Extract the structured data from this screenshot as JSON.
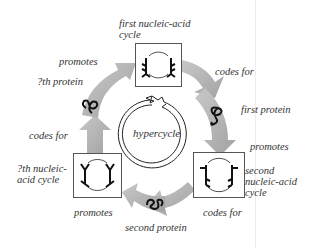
{
  "diagram": {
    "center_label": "hypercycle",
    "nodes": {
      "first_nucleic_acid_cycle": {
        "label_line1": "first nucleic-acid",
        "label_line2": "cycle"
      },
      "second_nucleic_acid_cycle": {
        "label_line1": "second",
        "label_line2": "nucleic-acid",
        "label_line3": "cycle"
      },
      "nth_nucleic_acid_cycle": {
        "label_line1": "?th nucleic-",
        "label_line2": "acid cycle"
      },
      "first_protein": {
        "label": "first protein"
      },
      "second_protein": {
        "label": "second protein"
      },
      "nth_protein": {
        "label": "?th protein"
      }
    },
    "edges": {
      "first_codes_for": "codes for",
      "first_protein_promotes": "promotes",
      "second_codes_for": "codes for",
      "second_protein_promotes": "promotes",
      "nth_codes_for": "codes for",
      "nth_protein_promotes": "promotes"
    },
    "colors": {
      "arrow_fill": "#a9a9a9",
      "arrow_fill_light": "#c4c4c4",
      "line": "#222222",
      "text": "#333333"
    }
  }
}
